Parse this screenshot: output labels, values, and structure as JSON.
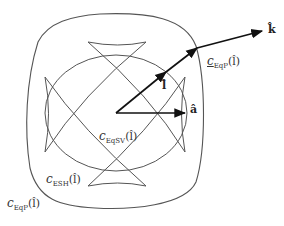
{
  "diagram": {
    "type": "vector-geometry",
    "colors": {
      "curve": "#555555",
      "arrow": "#111111",
      "label": "#333333"
    },
    "vectors": {
      "k": {
        "label": "k̂",
        "description": "unit vector k-hat (outer arrow tip)"
      },
      "l": {
        "label": "l̂",
        "description": "unit vector l-hat (diagonal arrow)"
      },
      "a": {
        "label": "â",
        "description": "unit vector a-hat (horizontal arrow)"
      }
    },
    "curves": {
      "eqp_outer": {
        "c": "c",
        "sub": "EqP",
        "arg": "(l̂)",
        "description": "outer rounded square curve"
      },
      "eqp_point": {
        "c": "c",
        "sub": "EqP",
        "arg": "(l̂)",
        "description": "point on outer curve where l-direction exits"
      },
      "esh": {
        "c": "c",
        "sub": "ESH",
        "arg": "(l̂)",
        "description": "astroid-like curve with four cusps"
      },
      "eqsv": {
        "c": "c",
        "sub": "EqSV",
        "arg": "(l̂)",
        "description": "inner ellipse-like curve"
      }
    }
  }
}
